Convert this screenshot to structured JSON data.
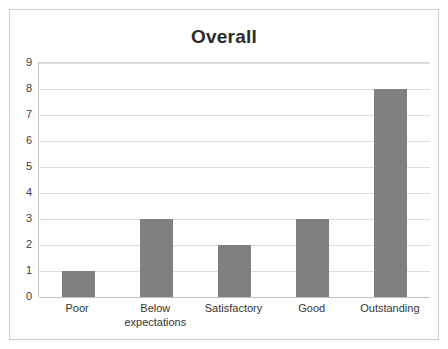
{
  "chart_data": {
    "type": "bar",
    "title": "Overall",
    "xlabel": "",
    "ylabel": "",
    "categories": [
      "Poor",
      "Below expectations",
      "Satisfactory",
      "Good",
      "Outstanding"
    ],
    "category_lines": [
      [
        "Poor"
      ],
      [
        "Below",
        "expectations"
      ],
      [
        "Satisfactory"
      ],
      [
        "Good"
      ],
      [
        "Outstanding"
      ]
    ],
    "values": [
      1,
      3,
      2,
      3,
      8
    ],
    "ylim": [
      0,
      9
    ],
    "ytick_labels": [
      "0",
      "1",
      "2",
      "3",
      "4",
      "5",
      "6",
      "7",
      "8",
      "9"
    ],
    "ytick_values": [
      0,
      1,
      2,
      3,
      4,
      5,
      6,
      7,
      8,
      9
    ],
    "grid": "horizontal",
    "legend": "none",
    "bar_color": "#808080",
    "gridline_color": "#dedede",
    "axis_color": "#c0c0c0",
    "background_color": "#ffffff",
    "title_color": "#2b2b2b",
    "tick_label_color": "#404040"
  }
}
